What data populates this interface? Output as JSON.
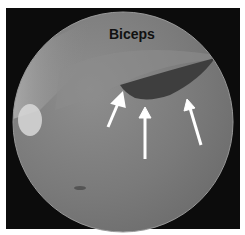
{
  "figure": {
    "label": "Biceps",
    "arrows": [
      {
        "name": "arrow-left"
      },
      {
        "name": "arrow-center"
      },
      {
        "name": "arrow-right"
      }
    ],
    "colors": {
      "background": "#0c0c0c",
      "view": "#7b7b7b",
      "arrow": "#ffffff",
      "label": "#111111"
    }
  }
}
